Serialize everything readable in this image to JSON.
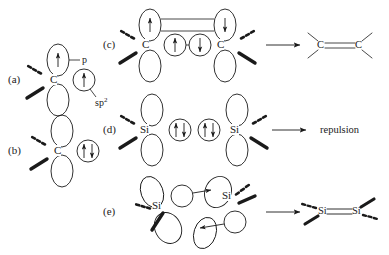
{
  "figure": {
    "width": 389,
    "height": 255,
    "background": "#ffffff",
    "ink": "#1a1a1a"
  },
  "panels": {
    "a": {
      "label": "(a)",
      "atom": "C",
      "p_orbital_label": "p",
      "hybrid_label_base": "sp",
      "hybrid_label_sup": "2"
    },
    "b": {
      "label": "(b)",
      "atom": "C"
    },
    "c": {
      "label": "(c)",
      "atom_left": "C",
      "atom_right": "C",
      "product_left": "C",
      "product_right": "C"
    },
    "d": {
      "label": "(d)",
      "atom_left": "Si",
      "atom_right": "Si",
      "result": "repulsion"
    },
    "e": {
      "label": "(e)",
      "atom_left": "Si",
      "atom_right": "Si",
      "product_left": "Si",
      "product_right": "Si"
    }
  },
  "spins": {
    "up": "up-arrow",
    "down": "down-arrow",
    "pair": "up-down-arrow-pair"
  }
}
